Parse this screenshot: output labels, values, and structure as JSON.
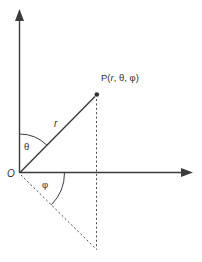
{
  "diagram": {
    "colors": {
      "line": "#3b3b3b",
      "text": "#2f2f2f",
      "background": "#ffffff"
    },
    "labels": {
      "origin": "O",
      "theta": "θ",
      "phi": "φ",
      "radius": "r",
      "point_prefix": "P(",
      "point_r": "r",
      "point_suffix": ", θ, φ)"
    }
  }
}
